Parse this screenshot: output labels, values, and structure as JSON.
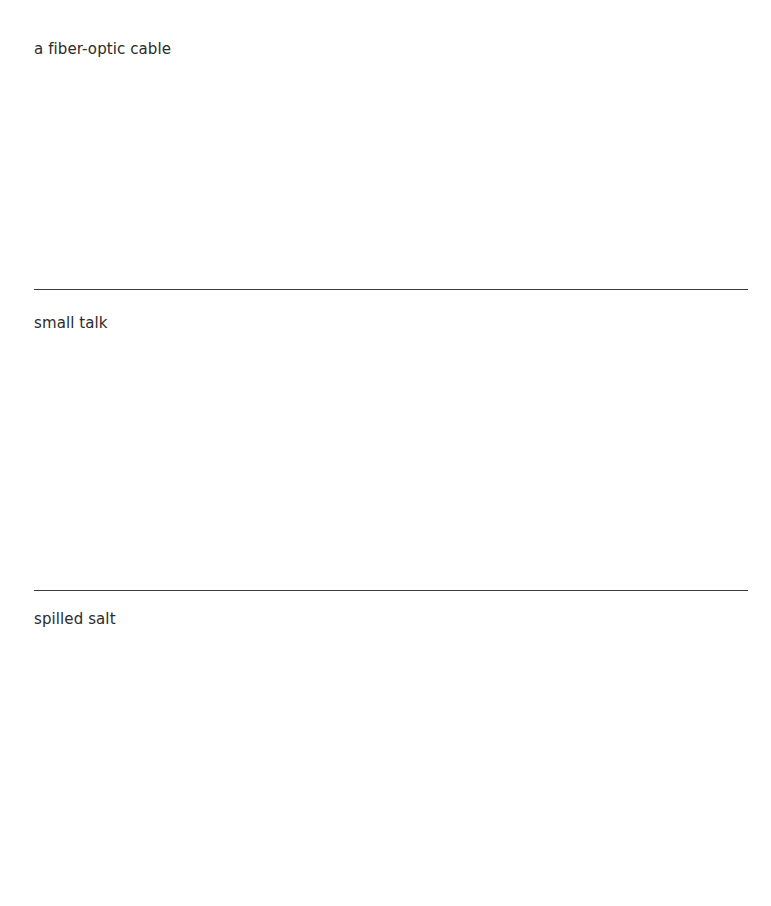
{
  "page": {
    "background_color": "#ffffff",
    "text_color": "#2b2b2b",
    "divider_color": "#3a3a3a"
  },
  "entries": [
    {
      "label": "a fiber-optic cable",
      "response": ""
    },
    {
      "label": "small talk",
      "response": ""
    },
    {
      "label": "spilled salt",
      "response": ""
    }
  ]
}
